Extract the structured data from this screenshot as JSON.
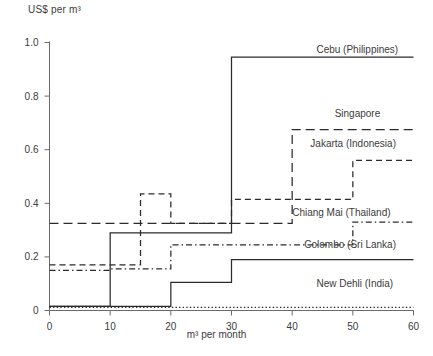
{
  "chart_data": {
    "type": "line",
    "title": "",
    "subtitle": "",
    "ylabel": "US$ per m³",
    "xlabel": "m³ per month",
    "xlim": [
      0,
      60
    ],
    "ylim": [
      0,
      1.0
    ],
    "xticks": [
      0,
      10,
      20,
      30,
      40,
      50,
      60
    ],
    "xtick_labels": [
      "0",
      "10",
      "20",
      "30",
      "40",
      "50",
      "60"
    ],
    "yticks": [
      0,
      0.2,
      0.4,
      0.6,
      0.8,
      1.0
    ],
    "ytick_labels": [
      "0",
      "0.2",
      "0.4",
      "0.6",
      "0.8",
      "1.0"
    ],
    "grid": false,
    "legend_position": "inline-right-of-line",
    "step_style": "post",
    "series": [
      {
        "name": "Cebu (Philippines)",
        "label": "Cebu (Philippines)",
        "linestyle": "solid",
        "color": "#2b2b2b",
        "label_x": 44,
        "label_y": 0.975,
        "x": [
          0,
          10,
          20,
          30,
          60
        ],
        "values": [
          0.015,
          0.29,
          0.29,
          0.945,
          0.945
        ]
      },
      {
        "name": "Singapore",
        "label": "Singapore",
        "linestyle": "long-dash",
        "color": "#2b2b2b",
        "label_x": 47,
        "label_y": 0.735,
        "x": [
          0,
          10,
          20,
          30,
          40,
          60
        ],
        "values": [
          0.325,
          0.325,
          0.325,
          0.325,
          0.675,
          0.675
        ]
      },
      {
        "name": "Jakarta (Indonesia)",
        "label": "Jakarta (Indonesia)",
        "linestyle": "dashed",
        "color": "#2b2b2b",
        "label_x": 43,
        "label_y": 0.625,
        "x": [
          0,
          10,
          15,
          20,
          30,
          50,
          60
        ],
        "values": [
          0.17,
          0.17,
          0.435,
          0.325,
          0.415,
          0.56,
          0.56
        ]
      },
      {
        "name": "Chiang Mai (Thailand)",
        "label": "Chiang Mai (Thailand)",
        "linestyle": "dash-dot",
        "color": "#2b2b2b",
        "label_x": 40,
        "label_y": 0.365,
        "x": [
          0,
          10,
          20,
          50,
          60
        ],
        "values": [
          0.15,
          0.155,
          0.245,
          0.33,
          0.33
        ]
      },
      {
        "name": "Colombo (Sri Lanka)",
        "label": "Colombo (Sri Lanka)",
        "linestyle": "solid",
        "color": "#2b2b2b",
        "label_x": 42,
        "label_y": 0.245,
        "x": [
          0,
          10,
          20,
          30,
          60
        ],
        "values": [
          0.015,
          0.015,
          0.105,
          0.19,
          0.19
        ]
      },
      {
        "name": "New Dehli (India)",
        "label": "New Dehli (India)",
        "linestyle": "dotted",
        "color": "#2b2b2b",
        "label_x": 44,
        "label_y": 0.1,
        "x": [
          0,
          60
        ],
        "values": [
          0.012,
          0.012
        ]
      }
    ]
  }
}
